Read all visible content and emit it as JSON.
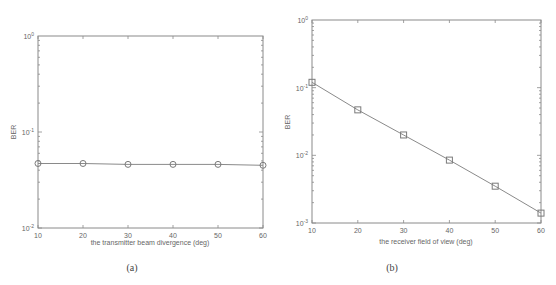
{
  "chart_data": [
    {
      "type": "line",
      "panel": "(a)",
      "title": "",
      "xlabel": "the transmitter beam divergence (deg)",
      "ylabel": "BER",
      "yscale": "log",
      "xlim": [
        10,
        60
      ],
      "ylim": [
        0.01,
        1
      ],
      "x_ticks": [
        "10",
        "20",
        "30",
        "40",
        "50",
        "60"
      ],
      "y_ticks": [
        {
          "base": "10",
          "exp": "-2",
          "value": 0.01
        },
        {
          "base": "10",
          "exp": "-1",
          "value": 0.1
        },
        {
          "base": "10",
          "exp": "0",
          "value": 1
        }
      ],
      "marker": "circle",
      "grid": false,
      "x": [
        10,
        20,
        30,
        40,
        50,
        60
      ],
      "series": [
        {
          "name": "BER",
          "values": [
            0.047,
            0.047,
            0.046,
            0.046,
            0.046,
            0.045
          ]
        }
      ]
    },
    {
      "type": "line",
      "panel": "(b)",
      "title": "",
      "xlabel": "the receiver field of view (deg)",
      "ylabel": "BER",
      "yscale": "log",
      "xlim": [
        10,
        60
      ],
      "ylim": [
        0.001,
        1
      ],
      "x_ticks": [
        "10",
        "20",
        "30",
        "40",
        "50",
        "60"
      ],
      "y_ticks": [
        {
          "base": "10",
          "exp": "-3",
          "value": 0.001
        },
        {
          "base": "10",
          "exp": "-2",
          "value": 0.01
        },
        {
          "base": "10",
          "exp": "-1",
          "value": 0.1
        },
        {
          "base": "10",
          "exp": "0",
          "value": 1
        }
      ],
      "marker": "square",
      "grid": false,
      "x": [
        10,
        20,
        30,
        40,
        50,
        60
      ],
      "series": [
        {
          "name": "BER",
          "values": [
            0.12,
            0.047,
            0.02,
            0.0085,
            0.0035,
            0.0014
          ]
        }
      ]
    }
  ],
  "captions": {
    "a": "(a)",
    "b": "(b)"
  }
}
